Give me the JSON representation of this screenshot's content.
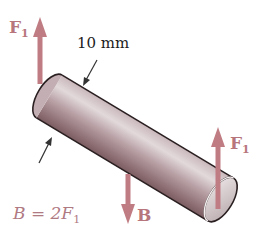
{
  "figure": {
    "type": "free-body diagram of a cylindrical rod",
    "colors": {
      "force_arrow": "#c07c83",
      "force_label": "#b7757c",
      "rod_light": "#ddd4d6",
      "rod_mid": "#b9a3a7",
      "rod_dark": "#8d6d72",
      "outline": "#2a1f21",
      "dimension_line": "#333333"
    }
  },
  "labels": {
    "force_top_left": {
      "symbol": "F",
      "subscript": "1"
    },
    "force_right": {
      "symbol": "F",
      "subscript": "1"
    },
    "force_bottom": {
      "symbol": "B"
    },
    "diameter": "10 mm",
    "relation": {
      "lhs": "B",
      "eq": " = 2F",
      "subscript": "1"
    }
  },
  "forces": [
    {
      "name": "F1",
      "direction": "up",
      "location": "left end of rod"
    },
    {
      "name": "B",
      "direction": "down",
      "location": "middle of rod"
    },
    {
      "name": "F1",
      "direction": "up",
      "location": "right end of rod"
    }
  ],
  "dimension": {
    "quantity": "diameter",
    "value": "10 mm"
  }
}
